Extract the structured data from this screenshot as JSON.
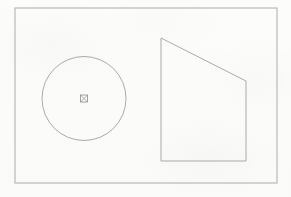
{
  "canvas": {
    "width": 291,
    "height": 197,
    "background_color": "#fdfdfc",
    "description": "Line drawing of a circle with a center cross-square marker beside a right trapezoid, enclosed in a rectangular frame"
  },
  "frame": {
    "name": "border-rectangle",
    "x": 15,
    "y": 8,
    "width": 262,
    "height": 175,
    "stroke_color": "#b3b3b3",
    "stroke_width": 1.1,
    "fill": "none"
  },
  "shapes": {
    "circle": {
      "label": "circle",
      "center_x": 84,
      "center_y": 98.5,
      "radius": 42,
      "stroke_color": "#a0a0a0",
      "stroke_width": 0.9,
      "fill": "none"
    },
    "center_marker": {
      "label": "center-point-marker",
      "glyph": "crossed-square",
      "center_x": 84,
      "center_y": 98.5,
      "size": 7,
      "stroke_color": "#8d8d8d",
      "stroke_width": 0.8,
      "fill": "none"
    },
    "trapezoid": {
      "label": "right-trapezoid",
      "points": "161,38 246,81 246,161 161,161",
      "vertices": [
        {
          "name": "top-left",
          "x": 161,
          "y": 38
        },
        {
          "name": "top-right",
          "x": 246,
          "y": 81
        },
        {
          "name": "bottom-right",
          "x": 246,
          "y": 161
        },
        {
          "name": "bottom-left",
          "x": 161,
          "y": 161
        }
      ],
      "stroke_color": "#a0a0a0",
      "stroke_width": 0.9,
      "fill": "none"
    }
  },
  "chart_data": {
    "type": "diagram",
    "title": "",
    "elements": [
      {
        "shape": "rectangle",
        "role": "frame",
        "x": 15,
        "y": 8,
        "width": 262,
        "height": 175
      },
      {
        "shape": "circle",
        "role": "figure",
        "cx": 84,
        "cy": 98.5,
        "r": 42
      },
      {
        "shape": "marker",
        "role": "center-point",
        "cx": 84,
        "cy": 98.5,
        "size": 7
      },
      {
        "shape": "polygon",
        "role": "figure",
        "sides": 4,
        "points": [
          [
            161,
            38
          ],
          [
            246,
            81
          ],
          [
            246,
            161
          ],
          [
            161,
            161
          ]
        ]
      }
    ],
    "legend": [],
    "grid": false
  }
}
